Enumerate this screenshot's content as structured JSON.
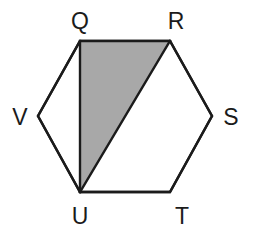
{
  "figure": {
    "name": "shaded-triangle-in-hexagon",
    "canvas": {
      "width": 253,
      "height": 242
    },
    "colors": {
      "background": "#ffffff",
      "stroke": "#1b1b1b",
      "shaded_fill": "#a8a8a8",
      "unshaded_fill": "#ffffff",
      "label_color": "#1b1b1b"
    },
    "stroke_width": 2.4,
    "polygon": {
      "name": "hexagon",
      "vertex_order": [
        "Q",
        "R",
        "S",
        "T",
        "U",
        "V"
      ],
      "points": "80,41 170,41 212,116 170,192 80,192 38,116"
    },
    "shaded_region": {
      "name": "triangle-QRU",
      "vertex_order": [
        "Q",
        "R",
        "U"
      ],
      "points": "80,41 170,41 80,192"
    },
    "segments": [
      {
        "name": "segment-QU",
        "from": "Q",
        "to": "U",
        "x1": 80,
        "y1": 41,
        "x2": 80,
        "y2": 192
      },
      {
        "name": "segment-RU",
        "from": "R",
        "to": "U",
        "x1": 170,
        "y1": 41,
        "x2": 80,
        "y2": 192
      }
    ],
    "vertices": [
      {
        "id": "Q",
        "label": "Q",
        "x": 80,
        "y": 41,
        "label_x": 80,
        "label_y": 29
      },
      {
        "id": "R",
        "label": "R",
        "x": 170,
        "y": 41,
        "label_x": 176,
        "label_y": 29
      },
      {
        "id": "S",
        "label": "S",
        "x": 212,
        "y": 116,
        "label_x": 231,
        "label_y": 125
      },
      {
        "id": "T",
        "label": "T",
        "x": 170,
        "y": 192,
        "label_x": 182,
        "label_y": 224
      },
      {
        "id": "U",
        "label": "U",
        "x": 80,
        "y": 192,
        "label_x": 80,
        "label_y": 224
      },
      {
        "id": "V",
        "label": "V",
        "x": 38,
        "y": 116,
        "label_x": 20,
        "label_y": 125
      }
    ]
  }
}
